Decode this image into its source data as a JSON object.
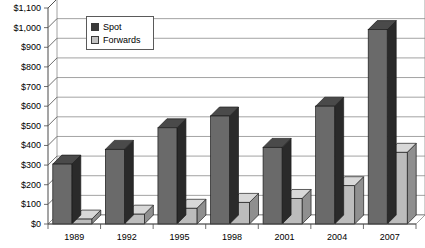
{
  "chart_data": {
    "type": "bar",
    "title": "",
    "xlabel": "",
    "ylabel": "",
    "categories": [
      "1989",
      "1992",
      "1995",
      "1998",
      "2001",
      "2004",
      "2007"
    ],
    "series": [
      {
        "name": "Spot",
        "values": [
          305,
          380,
          490,
          550,
          390,
          600,
          990
        ],
        "color": "#6a6a6a"
      },
      {
        "name": "Forwards",
        "values": [
          25,
          50,
          80,
          110,
          130,
          195,
          365
        ],
        "color": "#b9b9b9"
      }
    ],
    "ylim": [
      0,
      1100
    ],
    "ytick_step": 100,
    "ytick_labels": [
      "$0",
      "$100",
      "$200",
      "$300",
      "$400",
      "$500",
      "$600",
      "$700",
      "$800",
      "$900",
      "$1,000",
      "$1,100"
    ],
    "grid": true,
    "legend_position": "upper-left-inside",
    "style": "3d-clustered-column"
  },
  "legend": {
    "entries": [
      {
        "label": "Spot",
        "swatch_color": "#3a3a3a"
      },
      {
        "label": "Forwards",
        "swatch_color": "#c2c2c2"
      }
    ]
  },
  "colors": {
    "spot_front": "#6a6a6a",
    "spot_side": "#2a2a2a",
    "spot_top": "#4a4a4a",
    "forwards_front": "#bcbcbc",
    "forwards_side": "#8f8f8f",
    "forwards_top": "#d8d8d8",
    "gridline": "#8c8c8c",
    "axis": "#4a4a4a",
    "background": "#ffffff"
  }
}
